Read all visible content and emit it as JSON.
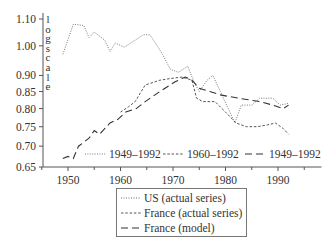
{
  "chart_data": {
    "type": "line",
    "title": "",
    "xlabel": "",
    "ylabel": "log scale",
    "yscale": "log",
    "xlim": [
      1945,
      1996
    ],
    "ylim": [
      0.65,
      1.1
    ],
    "x_ticks": [
      1950,
      1960,
      1970,
      1980,
      1990
    ],
    "x_minor_ticks": [
      1945,
      1955,
      1965,
      1975,
      1985,
      1995
    ],
    "y_ticks": [
      1.1,
      1.0,
      0.9,
      0.85,
      0.8,
      0.75,
      0.7,
      0.65
    ],
    "y_tick_labels": [
      "1.10",
      "1.00",
      "0.90",
      "0.85",
      "0.80",
      "0.75",
      "0.70",
      "0.65"
    ],
    "grid": false,
    "series": [
      {
        "name": "US (actual series)",
        "style": "dotted",
        "period": "1949–1992",
        "x": [
          1949,
          1951,
          1953,
          1954,
          1955,
          1957,
          1958,
          1959,
          1960.7,
          1962.8,
          1964.3,
          1965.6,
          1967,
          1968,
          1969.5,
          1971,
          1972.8,
          1974,
          1975,
          1976.5,
          1977.6,
          1979,
          1981.8,
          1983,
          1985,
          1986.5,
          1989,
          1990.4,
          1992
        ],
        "values": [
          0.97,
          1.08,
          1.075,
          1.03,
          1.05,
          1.02,
          0.98,
          1.01,
          0.995,
          1.02,
          1.04,
          1.04,
          1.0,
          0.97,
          0.92,
          0.91,
          0.93,
          0.88,
          0.85,
          0.885,
          0.9,
          0.85,
          0.76,
          0.81,
          0.81,
          0.83,
          0.83,
          0.81,
          0.815
        ]
      },
      {
        "name": "France (actual series)",
        "style": "short-dash",
        "period": "1960–1992",
        "x": [
          1960,
          1961.5,
          1962.8,
          1964.7,
          1967.5,
          1969.4,
          1971.7,
          1973.6,
          1974.5,
          1975.7,
          1978,
          1980,
          1982,
          1984,
          1986,
          1988,
          1989.5,
          1991,
          1992
        ],
        "values": [
          0.79,
          0.805,
          0.82,
          0.87,
          0.885,
          0.89,
          0.895,
          0.885,
          0.83,
          0.82,
          0.82,
          0.79,
          0.76,
          0.75,
          0.75,
          0.755,
          0.76,
          0.745,
          0.73
        ]
      },
      {
        "name": "France (model)",
        "style": "long-dash",
        "period": "1949–1992",
        "x": [
          1949,
          1950,
          1951,
          1952,
          1954,
          1955,
          1956,
          1958,
          1959.5,
          1961,
          1963,
          1964.7,
          1967.5,
          1970.4,
          1972.3,
          1973.6,
          1975,
          1977,
          1979,
          1982.5,
          1986.5,
          1989,
          1991,
          1992
        ],
        "values": [
          0.67,
          0.675,
          0.67,
          0.7,
          0.72,
          0.74,
          0.73,
          0.76,
          0.77,
          0.79,
          0.8,
          0.82,
          0.85,
          0.88,
          0.895,
          0.885,
          0.86,
          0.85,
          0.84,
          0.83,
          0.82,
          0.81,
          0.8,
          0.81
        ]
      }
    ],
    "inline_legend": [
      {
        "style": "dotted",
        "label": "1949–1992"
      },
      {
        "style": "short-dash",
        "label": "1960–1992"
      },
      {
        "style": "long-dash",
        "label": "1949–1992"
      }
    ],
    "legend": {
      "placement": "bottom-center",
      "entries": [
        {
          "style": "dotted",
          "label": "US (actual series)"
        },
        {
          "style": "short-dash",
          "label": "France (actual series)"
        },
        {
          "style": "long-dash",
          "label": "France (model)"
        }
      ]
    }
  }
}
